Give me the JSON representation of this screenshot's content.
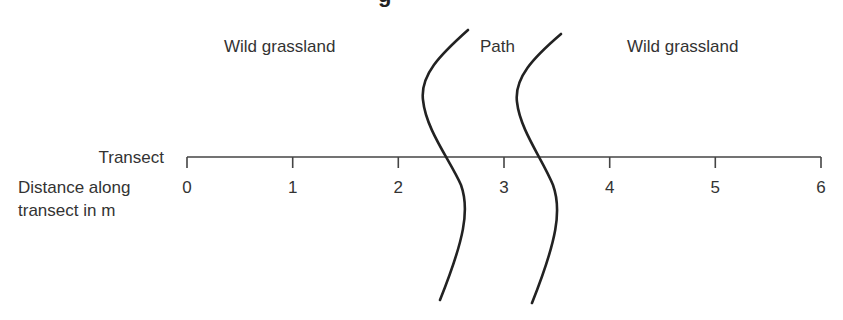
{
  "heading": {
    "visible_fragment": "g",
    "clipped": true
  },
  "regions": {
    "left_label": "Wild grassland",
    "middle_label": "Path",
    "right_label": "Wild grassland"
  },
  "transect": {
    "label": "Transect",
    "axis_label_line1": "Distance along",
    "axis_label_line2": "transect in m",
    "unit": "m",
    "range": [
      0,
      6
    ],
    "ticks": [
      "0",
      "1",
      "2",
      "3",
      "4",
      "5",
      "6"
    ]
  },
  "path_boundaries": {
    "left_crossing_m": 2.6,
    "right_crossing_m": 3.4
  },
  "colors": {
    "line": "#222222",
    "text": "#333333",
    "background": "#ffffff"
  }
}
